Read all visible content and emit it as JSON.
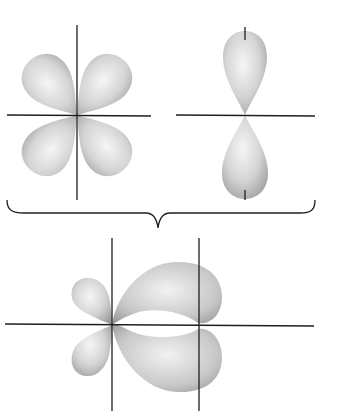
{
  "diagram": {
    "colors": {
      "background": "#ffffff",
      "axis": "#1e1e1e",
      "lobe_light": "#f4f4f4",
      "lobe_dark": "#9a9a9a"
    },
    "panels": [
      {
        "name": "d-orbital",
        "axes_center": [
          77,
          115
        ],
        "lobes": 4
      },
      {
        "name": "p-orbital",
        "axes_center": [
          245,
          115
        ],
        "lobes": 2
      },
      {
        "name": "combined-overlap",
        "axes_centers": [
          [
            112,
            325
          ],
          [
            199,
            325
          ]
        ],
        "lobes": 4
      }
    ],
    "labels": []
  }
}
